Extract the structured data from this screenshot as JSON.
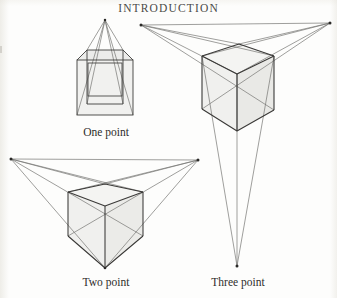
{
  "page": {
    "running_head": "INTRODUCTION",
    "background_color": "#fdfdfc",
    "ink_color": "#3a3937",
    "construction_line_color": "#6e6d6b",
    "cube_fill_color": "#f1f1ef",
    "cube_fill_shade_color": "#e9e9e6",
    "caption_color": "#2e2d2b"
  },
  "figures": [
    {
      "id": "one-point",
      "caption": "One point",
      "vanishing_points": 1,
      "vanishing_point_coords": [
        [
          105,
          20
        ]
      ]
    },
    {
      "id": "two-point",
      "caption": "Two point",
      "vanishing_points": 2,
      "vanishing_point_coords": [
        [
          11,
          159
        ],
        [
          198,
          160
        ]
      ]
    },
    {
      "id": "three-point",
      "caption": "Three point",
      "vanishing_points": 3,
      "vanishing_point_coords": [
        [
          141,
          25
        ],
        [
          330,
          23
        ],
        [
          237,
          266
        ]
      ]
    }
  ]
}
